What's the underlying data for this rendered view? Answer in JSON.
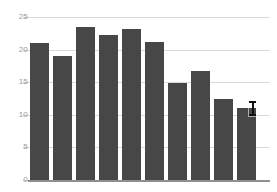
{
  "chart_data": {
    "type": "bar",
    "title": "",
    "subtitle": "",
    "xlabel": "",
    "ylabel": "",
    "categories": [
      "1",
      "2",
      "3",
      "4",
      "5",
      "6",
      "7",
      "8",
      "9",
      "10"
    ],
    "values": [
      21.0,
      19.0,
      23.5,
      22.3,
      23.1,
      21.2,
      14.9,
      16.7,
      12.4,
      11.0
    ],
    "series": [
      {
        "name": "series-1",
        "values": [
          21.0,
          19.0,
          23.5,
          22.3,
          23.1,
          21.2,
          14.9,
          16.7,
          12.4,
          11.0
        ]
      }
    ],
    "ylim": [
      0,
      25
    ],
    "xlim": [
      0,
      10
    ],
    "yticks": [
      0,
      5,
      10,
      15,
      20,
      25
    ],
    "ytick_labels": [
      "0",
      "5",
      "10",
      "15",
      "20",
      "25"
    ],
    "xtick_labels": [],
    "grid": true,
    "grid_axis": "y",
    "legend": false,
    "legend_position": "none",
    "annotations": []
  },
  "colors": {
    "bar": "#474747",
    "gridline": "#d9d9d9",
    "axis_line": "#8e8e8e",
    "tick_label": "#9a9a9a",
    "background": "#ffffff",
    "cursor": "#111111"
  },
  "cursor": {
    "icon": "text-ibeam-cursor",
    "x": 248,
    "y": 100,
    "over_bar_index": 9
  }
}
